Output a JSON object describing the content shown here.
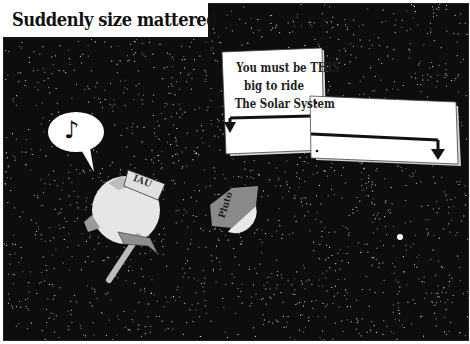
{
  "caption": "Suddenly size mattered ...",
  "sign": {
    "lines": [
      "You must be THIS",
      "big to ride",
      "The Solar System"
    ]
  },
  "characters": {
    "hat_label_left": "IAU",
    "hat_label_right": "Pluto",
    "speech_bubble_icon": "music-note-icon",
    "speech_bubble_glyph": "♪"
  },
  "colors": {
    "space": "#0d0d0d",
    "sign": "#ffffff",
    "planet": "#e6e6e6",
    "hat_gray": "#8a8a8a",
    "hammer_gray": "#9a9a9a"
  }
}
